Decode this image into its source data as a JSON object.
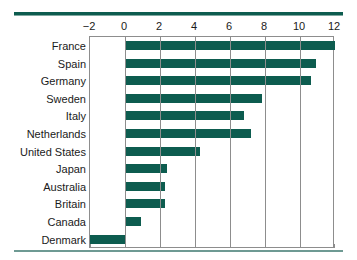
{
  "chart_data": {
    "type": "bar",
    "orientation": "horizontal",
    "title": "",
    "subtitle": "",
    "xlabel": "",
    "ylabel": "",
    "categories": [
      "France",
      "Spain",
      "Germany",
      "Sweden",
      "Italy",
      "Netherlands",
      "United States",
      "Japan",
      "Australia",
      "Britain",
      "Canada",
      "Denmark"
    ],
    "values": [
      12.0,
      10.9,
      10.6,
      7.8,
      6.8,
      7.2,
      4.3,
      2.4,
      2.3,
      2.3,
      0.9,
      -2.0
    ],
    "series": [
      {
        "name": "",
        "values": [
          12.0,
          10.9,
          10.6,
          7.8,
          6.8,
          7.2,
          4.3,
          2.4,
          2.3,
          2.3,
          0.9,
          -2.0
        ]
      }
    ],
    "xlim": [
      -2,
      12
    ],
    "xticks": [
      -2,
      0,
      2,
      4,
      6,
      8,
      10,
      12
    ],
    "xtick_labels": [
      "−2",
      "0",
      "2",
      "4",
      "6",
      "8",
      "10",
      "12"
    ],
    "grid": "vertical",
    "legend": "none",
    "bar_color": "#0d5c4f",
    "axis_color": "#8d8d8d",
    "rule_color": "#0d5c4f"
  }
}
